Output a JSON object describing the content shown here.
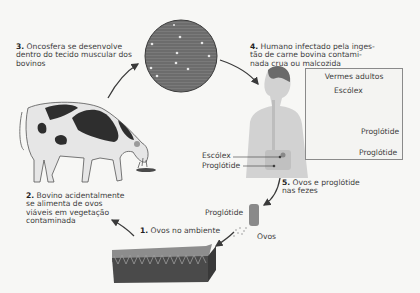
{
  "diagram": {
    "steps": [
      {
        "number": "1.",
        "text": "Ovos no ambiente"
      },
      {
        "number": "2.",
        "lines": [
          "Bovino acidentalmente",
          "se alimenta de ovos",
          "viáveis em vegetação",
          "contaminada"
        ]
      },
      {
        "number": "3.",
        "lines": [
          "Oncosfera se desenvolve",
          "dentro do tecido muscular dos",
          "bovinos"
        ]
      },
      {
        "number": "4.",
        "lines": [
          "Humano infectado pela inges-",
          "tão de carne bovina contami-",
          "nada crua ou malcozida"
        ]
      },
      {
        "number": "5.",
        "lines": [
          "Ovos e proglótide",
          "nas fezes"
        ]
      }
    ],
    "human_labels": {
      "scolex": "Escólex",
      "proglottid": "Proglótide"
    },
    "inset": {
      "title": "Vermes adultos",
      "scolex": "Escólex",
      "proglottid_top": "Proglótide",
      "proglottid_bottom": "Proglótide"
    },
    "feces_labels": {
      "proglottid": "Proglótide",
      "eggs": "Ovos"
    },
    "colors": {
      "background": "#f7f7f5",
      "muscle": "#6f6f6f",
      "cow_spots": "#2e2e2e",
      "soil": "#4a4a4a",
      "grass": "#8d8d8d",
      "human": "#cfcfcf",
      "arrow": "#3a3a3a"
    }
  }
}
